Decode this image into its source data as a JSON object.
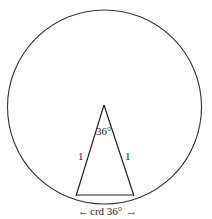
{
  "diagram": {
    "angle_label": "36°",
    "left_side_label": "1",
    "right_side_label": "1",
    "chord_label": "crd 36°",
    "arrow_left": "←",
    "arrow_right": "→"
  }
}
